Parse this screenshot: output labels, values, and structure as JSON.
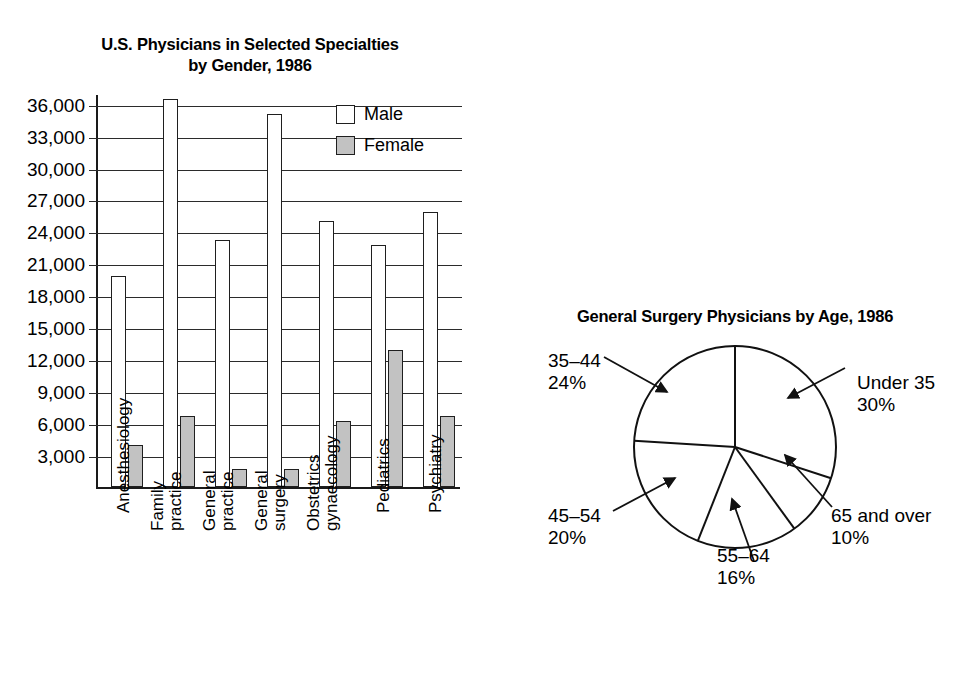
{
  "bar_chart": {
    "title_line1": "U.S. Physicians in Selected Specialties",
    "title_line2": "by Gender, 1986",
    "legend": [
      {
        "label": "Male",
        "swatch": "white-square-icon"
      },
      {
        "label": "Female",
        "swatch": "gray-square-icon"
      }
    ]
  },
  "pie_chart": {
    "title": "General Surgery Physicians by Age, 1986"
  },
  "chart_data": [
    {
      "type": "bar",
      "title": "U.S. Physicians in Selected Specialties by Gender, 1986",
      "xlabel": "",
      "ylabel": "",
      "ylim": [
        0,
        37000
      ],
      "grid": true,
      "legend_position": "top-right",
      "yticks": [
        "3,000",
        "6,000",
        "9,000",
        "12,000",
        "15,000",
        "18,000",
        "21,000",
        "24,000",
        "27,000",
        "30,000",
        "33,000",
        "36,000"
      ],
      "ytick_values": [
        3000,
        6000,
        9000,
        12000,
        15000,
        18000,
        21000,
        24000,
        27000,
        30000,
        33000,
        36000
      ],
      "categories": [
        "Anesthesiology",
        "Family practice",
        "General practice",
        "General surgery",
        "Obstetrics gynaecology",
        "Pediatrics",
        "Psychiatry"
      ],
      "category_lines": [
        [
          "Anesthesiology"
        ],
        [
          "Family",
          "practice"
        ],
        [
          "General",
          "practice"
        ],
        [
          "General",
          "surgery"
        ],
        [
          "Obstetrics",
          "gynaecology"
        ],
        [
          "Pediatrics"
        ],
        [
          "Psychiatry"
        ]
      ],
      "series": [
        {
          "name": "Male",
          "color": "#ffffff",
          "values": [
            19800,
            36400,
            23200,
            35000,
            25000,
            22700,
            25800
          ]
        },
        {
          "name": "Female",
          "color": "#c2c2c2",
          "values": [
            3900,
            6700,
            1700,
            1700,
            6200,
            12900,
            6700
          ]
        }
      ]
    },
    {
      "type": "pie",
      "title": "General Surgery Physicians by Age, 1986",
      "labels": [
        "Under 35",
        "65 and over",
        "55–64",
        "45–54",
        "35–44"
      ],
      "values": [
        30,
        16,
        10,
        20,
        24
      ],
      "display_order": [
        "Under 35",
        "65 and over",
        "55–64",
        "45–54",
        "35–44"
      ],
      "slices": [
        {
          "label": "Under 35",
          "pct": "30%",
          "value": 30
        },
        {
          "label": "65 and over",
          "pct": "10%",
          "value": 10
        },
        {
          "label": "55–64",
          "pct": "16%",
          "value": 16
        },
        {
          "label": "45–54",
          "pct": "20%",
          "value": 20
        },
        {
          "label": "35–44",
          "pct": "24%",
          "value": 24
        }
      ],
      "legend_position": "callout-labels",
      "grid": false
    }
  ],
  "colors": {
    "male_fill": "#ffffff",
    "female_fill": "#c2c2c2",
    "stroke": "#1f1f1f",
    "background": "#ffffff"
  }
}
